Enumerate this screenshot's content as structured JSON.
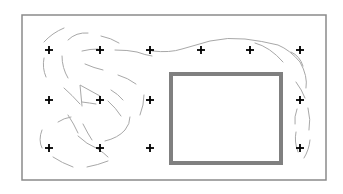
{
  "diagram": {
    "field": {
      "x": 22,
      "y": 15,
      "width": 304,
      "height": 165,
      "stroke": "#8a8a8a",
      "stroke_width": 1.5
    },
    "obstacle": {
      "x": 171,
      "y": 74,
      "width": 110,
      "height": 89,
      "stroke": "#808080",
      "stroke_width": 4,
      "fill": "#ffffff"
    },
    "nodes": [
      {
        "id": "n1",
        "x": 49,
        "y": 50
      },
      {
        "id": "n2",
        "x": 100,
        "y": 50
      },
      {
        "id": "n3",
        "x": 150,
        "y": 50
      },
      {
        "id": "n4",
        "x": 201,
        "y": 50
      },
      {
        "id": "n5",
        "x": 250,
        "y": 50
      },
      {
        "id": "n6",
        "x": 300,
        "y": 50
      },
      {
        "id": "n7",
        "x": 49,
        "y": 100
      },
      {
        "id": "n8",
        "x": 100,
        "y": 100
      },
      {
        "id": "n9",
        "x": 150,
        "y": 100
      },
      {
        "id": "n10",
        "x": 300,
        "y": 100
      },
      {
        "id": "n11",
        "x": 49,
        "y": 148
      },
      {
        "id": "n12",
        "x": 100,
        "y": 148
      },
      {
        "id": "n13",
        "x": 150,
        "y": 148
      },
      {
        "id": "n14",
        "x": 300,
        "y": 148
      }
    ],
    "node_color": "#000000",
    "trajectory_color": "#a8a8a8",
    "trajectories": [
      "M 44 42 Q 52 33 64 28",
      "M 68 40 Q 76 32 88 33",
      "M 101 36 Q 111 38 119 43",
      "M 82 51 Q 90 49 98 49",
      "M 115 50 Q 128 50 137 52 Q 145 55 152 56",
      "M 152 51 Q 170 53 182 49 Q 196 45 210 41 Q 228 37 245 39 Q 262 41 278 45 Q 290 50 300 62 Q 308 76 306 88",
      "M 255 43 Q 270 47 283 62",
      "M 291 52 Q 300 56 303 66",
      "M 44 58 Q 42 68 46 77",
      "M 62 56 Q 62 68 68 78",
      "M 85 64 Q 94 68 103 70",
      "M 118 75 Q 128 78 136 84",
      "M 64 88 Q 72 95 80 104",
      "M 82 106 L 80 85 L 100 96",
      "M 82 102 Q 90 103 96 104",
      "M 108 101 Q 116 108 121 116",
      "M 111 90 Q 118 94 123 100",
      "M 144 95 Q 144 105 140 115",
      "M 58 122 Q 64 118 71 117",
      "M 68 115 Q 74 124 78 133",
      "M 83 124 Q 88 134 92 140",
      "M 78 136 Q 86 144 98 149 Q 104 153 108 157",
      "M 105 141 Q 118 138 125 130 Q 130 124 130 117",
      "M 42 130 Q 38 140 42 148",
      "M 53 157 Q 62 163 73 167",
      "M 87 167 Q 98 165 108 161",
      "M 296 82 Q 302 90 305 98",
      "M 297 109 Q 294 117 295 124",
      "M 296 132 Q 294 142 298 152",
      "M 308 108 Q 311 120 309 130",
      "M 310 140 Q 309 150 304 158"
    ]
  }
}
